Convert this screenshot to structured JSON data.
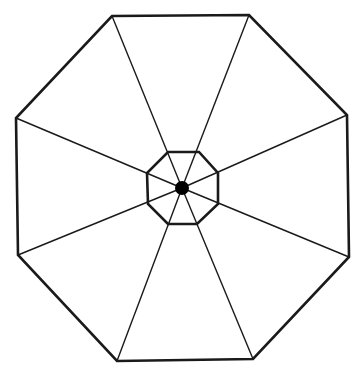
{
  "diagram": {
    "title": "",
    "stroke_color": "#1a1a1a",
    "fill_color": "#000000",
    "background": "#ffffff",
    "outer_octagon": {
      "points": [
        [
          112,
          16
        ],
        [
          249,
          15
        ],
        [
          347,
          115
        ],
        [
          349,
          257
        ],
        [
          253,
          359
        ],
        [
          117,
          361
        ],
        [
          18,
          255
        ],
        [
          16,
          118
        ]
      ],
      "stroke_width": 2.6
    },
    "inner_octagon": {
      "points": [
        [
          168,
          152
        ],
        [
          199,
          152
        ],
        [
          218,
          173
        ],
        [
          218,
          204
        ],
        [
          197,
          224
        ],
        [
          168,
          224
        ],
        [
          148,
          204
        ],
        [
          147,
          173
        ]
      ],
      "stroke_width": 2.6
    },
    "ribs": {
      "center": [
        182,
        188
      ],
      "ends": [
        [
          112,
          16
        ],
        [
          249,
          15
        ],
        [
          347,
          115
        ],
        [
          349,
          257
        ],
        [
          253,
          359
        ],
        [
          117,
          361
        ],
        [
          18,
          255
        ],
        [
          16,
          118
        ]
      ],
      "stroke_width": 1.4
    },
    "hub": {
      "center": [
        182,
        188
      ],
      "radius": 7
    }
  }
}
